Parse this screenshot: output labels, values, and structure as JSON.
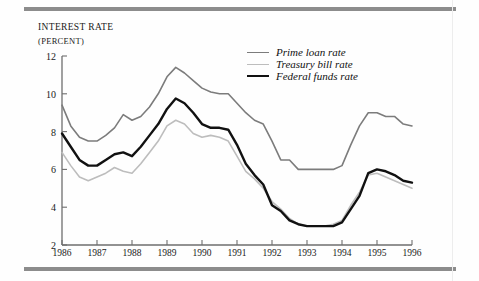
{
  "figure": {
    "axis_title_line1": "Interest rate",
    "axis_title_line2": "(percent)",
    "top_rule": "horizontal-rule",
    "bottom_rule": "horizontal-rule"
  },
  "legend": {
    "items": [
      {
        "label": "Prime loan rate",
        "color": "#7c7c7c",
        "width": 1.6
      },
      {
        "label": "Treasury bill rate",
        "color": "#bdbdbd",
        "width": 1.6
      },
      {
        "label": "Federal funds rate",
        "color": "#111111",
        "width": 2.4
      }
    ]
  },
  "chart_data": {
    "type": "line",
    "title": "Interest rate (percent)",
    "xlabel": "",
    "ylabel": "Interest rate (percent)",
    "xlim": [
      1986,
      1996
    ],
    "ylim": [
      2,
      12
    ],
    "yticks": [
      2,
      4,
      6,
      8,
      10,
      12
    ],
    "xticks": [
      1986,
      1987,
      1988,
      1989,
      1990,
      1991,
      1992,
      1993,
      1994,
      1995,
      1996
    ],
    "xtick_labels": [
      "1986",
      "1987",
      "1988",
      "1989",
      "1990",
      "1991",
      "1992",
      "1993",
      "1994",
      "1995",
      "1996"
    ],
    "ytick_labels": [
      "2",
      "4",
      "6",
      "8",
      "10",
      "12"
    ],
    "grid": false,
    "legend_position": "upper right",
    "x": [
      1986.0,
      1986.25,
      1986.5,
      1986.75,
      1987.0,
      1987.25,
      1987.5,
      1987.75,
      1988.0,
      1988.25,
      1988.5,
      1988.75,
      1989.0,
      1989.25,
      1989.5,
      1989.75,
      1990.0,
      1990.25,
      1990.5,
      1990.75,
      1991.0,
      1991.25,
      1991.5,
      1991.75,
      1992.0,
      1992.25,
      1992.5,
      1992.75,
      1993.0,
      1993.25,
      1993.5,
      1993.75,
      1994.0,
      1994.25,
      1994.5,
      1994.75,
      1995.0,
      1995.25,
      1995.5,
      1995.75,
      1996.0
    ],
    "series": [
      {
        "name": "Prime loan rate",
        "color": "#7c7c7c",
        "values": [
          9.4,
          8.3,
          7.7,
          7.5,
          7.5,
          7.8,
          8.2,
          8.9,
          8.6,
          8.8,
          9.3,
          10.0,
          10.9,
          11.4,
          11.1,
          10.7,
          10.3,
          10.1,
          10.0,
          10.0,
          9.5,
          9.0,
          8.6,
          8.4,
          7.5,
          6.5,
          6.5,
          6.0,
          6.0,
          6.0,
          6.0,
          6.0,
          6.2,
          7.3,
          8.3,
          9.0,
          9.0,
          8.8,
          8.8,
          8.4,
          8.3
        ]
      },
      {
        "name": "Treasury bill rate",
        "color": "#bdbdbd",
        "values": [
          6.9,
          6.2,
          5.6,
          5.4,
          5.6,
          5.8,
          6.1,
          5.9,
          5.8,
          6.3,
          6.9,
          7.5,
          8.3,
          8.6,
          8.4,
          7.9,
          7.7,
          7.8,
          7.7,
          7.5,
          6.7,
          5.9,
          5.5,
          5.0,
          4.3,
          3.9,
          3.4,
          3.1,
          3.0,
          3.0,
          3.0,
          3.1,
          3.3,
          4.1,
          4.8,
          5.7,
          5.8,
          5.6,
          5.4,
          5.2,
          5.0
        ]
      },
      {
        "name": "Federal funds rate",
        "color": "#111111",
        "values": [
          7.9,
          7.2,
          6.5,
          6.2,
          6.2,
          6.5,
          6.8,
          6.9,
          6.7,
          7.2,
          7.8,
          8.4,
          9.2,
          9.75,
          9.5,
          9.0,
          8.4,
          8.2,
          8.2,
          8.1,
          7.3,
          6.3,
          5.7,
          5.2,
          4.1,
          3.8,
          3.3,
          3.1,
          3.0,
          3.0,
          3.0,
          3.0,
          3.2,
          3.9,
          4.6,
          5.8,
          6.0,
          5.9,
          5.7,
          5.4,
          5.3
        ]
      }
    ]
  }
}
